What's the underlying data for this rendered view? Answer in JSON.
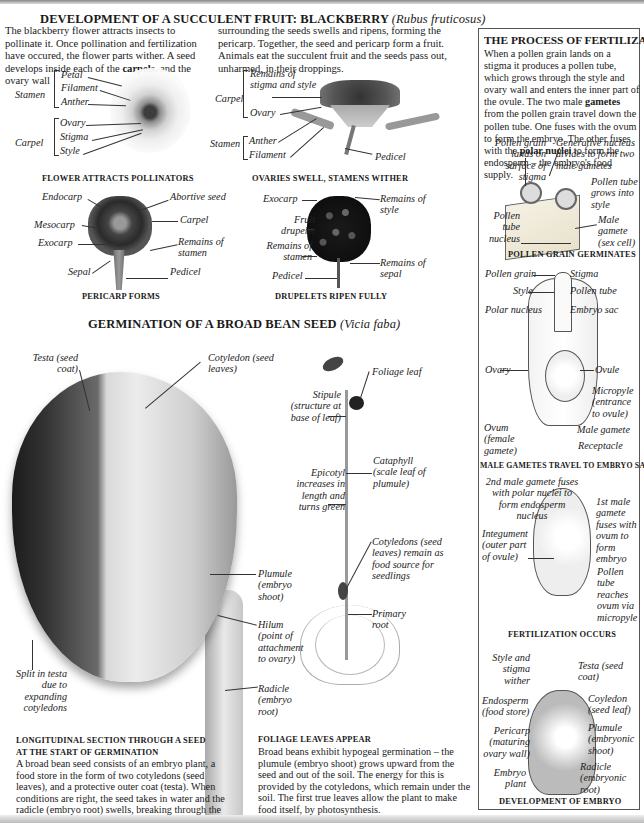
{
  "blackberry": {
    "title_main": "DEVELOPMENT OF A SUCCULENT FRUIT: BLACKBERRY",
    "title_latin": "(Rubus fruticosus)",
    "text_col1": "The blackberry flower attracts insects to pollinate it. Once pollination and fertilization have occured, the flower parts wither. A seed develops inside each of the",
    "text_col1_bold": "carpels,",
    "text_col1_end": " and the ovary wall",
    "text_col2": "surrounding the seeds swells and ripens, forming the pericarp. Together, the seed and pericarp form a fruit. Animals eat the succulent fruit and the seeds pass out, unharmed, in their droppings.",
    "stages": [
      {
        "caption": "FLOWER ATTRACTS POLLINATORS",
        "groups": [
          {
            "name": "Stamen",
            "parts": [
              "Petal",
              "Filament",
              "Anther"
            ]
          },
          {
            "name": "Carpel",
            "parts": [
              "Ovary",
              "Stigma",
              "Style"
            ]
          }
        ]
      },
      {
        "caption": "OVARIES SWELL, STAMENS WITHER",
        "groups": [
          {
            "name": "Carpel",
            "parts": [
              "Remains of stigma and style",
              "Ovary"
            ]
          },
          {
            "name": "Stamen",
            "parts": [
              "Anther",
              "Filament"
            ]
          }
        ],
        "labels": [
          "Pedicel"
        ]
      },
      {
        "caption": "PERICARP FORMS",
        "labels": [
          "Endocarp",
          "Mesocarp",
          "Exocarp",
          "Sepal",
          "Abortive seed",
          "Carpel",
          "Remains of stamen",
          "Pedicel"
        ]
      },
      {
        "caption": "DRUPELETS RIPEN FULLY",
        "labels": [
          "Exocarp",
          "Fruit drupelet",
          "Remains of stamen",
          "Pedicel",
          "Remains of style",
          "Remains of sepal"
        ]
      }
    ]
  },
  "germination": {
    "title_main": "GERMINATION OF A BROAD BEAN SEED",
    "title_latin": "(Vicia faba)",
    "seed_labels": {
      "testa": "Testa (seed coat)",
      "cotyledon": "Cotyledon (seed leaves)",
      "plumule": "Plumule (embryo shoot)",
      "hilum": "Hilum (point of attachment to ovary)",
      "radicle": "Radicle (embryo root)",
      "split": "Split in testa due to expanding cotyledons"
    },
    "seedling_labels": {
      "foliage_leaf": "Foliage leaf",
      "stipule": "Stipule (structure at base of leaf)",
      "cataphyll": "Cataphyll (scale leaf of plumule)",
      "epicotyl": "Epicotyl increases in length and turns green",
      "cotyledons": "Cotyledons (seed leaves) remain as food source for seedlings",
      "primary_root": "Primary root"
    },
    "section_caption": "LONGITUDINAL SECTION THROUGH A SEED AT THE START OF GERMINATION",
    "section_text": "A broad bean seed consists of an embryo plant, a food store in the form of two cotyledons (seed leaves), and a protective outer coat (testa). When conditions are right, the seed takes in water and the radicle (embryo root) swells, breaking through the testa and growing downward.",
    "foliage_caption": "FOLIAGE LEAVES APPEAR",
    "foliage_text": "Broad beans exhibit hypogeal germination – the plumule (embryo shoot) grows upward from the seed and out of the soil. The energy for this is provided by the cotyledons, which remain under the soil. The first true leaves allow the plant to make food itself, by photosynthesis."
  },
  "fertilization": {
    "title": "THE PROCESS OF FERTILIZATION",
    "text_a": "When a pollen grain lands on a stigma it produces a pollen tube, which grows through the style and ovary wall and enters the inner part of the ovule. The two male ",
    "text_bold1": "gametes",
    "text_b": " from the pollen grain travel down the pollen tube. One fuses with the ovum to form the embryo. The other fuses with the ",
    "text_bold2": "polar nuclei",
    "text_c": " to form the endosperm – the embryo's food supply.",
    "stages": [
      {
        "caption": "POLLEN GRAIN GERMINATES",
        "labels": [
          "Pollen grain lands on surface of stigma",
          "Generative nucleus divides to form two male gametes",
          "Pollen tube grows into style",
          "Pollen tube nucleus",
          "Male gamete (sex cell)"
        ]
      },
      {
        "caption": "MALE GAMETES TRAVEL TO EMBRYO SAC",
        "labels": [
          "Pollen grain",
          "Stigma",
          "Style",
          "Pollen tube",
          "Polar nucleus",
          "Embryo sac",
          "Ovary",
          "Ovule",
          "Micropyle (entrance to ovule)",
          "Ovum (female gamete)",
          "Male gamete",
          "Receptacle"
        ]
      },
      {
        "caption": "FERTILIZATION OCCURS",
        "labels": [
          "2nd male gamete fuses with polar nuclei to form endosperm nucleus",
          "1st male gamete fuses with ovum to form embryo",
          "Integument (outer part of ovule)",
          "Pollen tube reaches ovum via micropyle"
        ]
      },
      {
        "caption": "DEVELOPMENT OF EMBRYO",
        "labels": [
          "Style and stigma wither",
          "Testa (seed coat)",
          "Endosperm (food store)",
          "Coyledon (seed leaf)",
          "Pericarp (maturing ovary wall)",
          "Plumule (embryonic shoot)",
          "Embryo plant",
          "Radicle (embryonic root)"
        ]
      }
    ]
  }
}
